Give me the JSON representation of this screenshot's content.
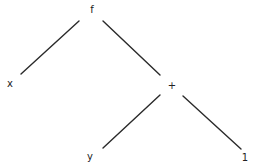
{
  "diagram": {
    "type": "expression-tree",
    "nodes": [
      {
        "id": "f",
        "label": "f",
        "x": 92,
        "y": 10
      },
      {
        "id": "x",
        "label": "x",
        "x": 10,
        "y": 84
      },
      {
        "id": "plus",
        "label": "+",
        "x": 172,
        "y": 86
      },
      {
        "id": "y",
        "label": "y",
        "x": 90,
        "y": 157
      },
      {
        "id": "one",
        "label": "1",
        "x": 245,
        "y": 158
      }
    ],
    "edges": [
      {
        "from": "f",
        "to": "x",
        "x1": 79,
        "y1": 21,
        "x2": 21,
        "y2": 74
      },
      {
        "from": "f",
        "to": "plus",
        "x1": 103,
        "y1": 21,
        "x2": 160,
        "y2": 75
      },
      {
        "from": "plus",
        "to": "y",
        "x1": 160,
        "y1": 95,
        "x2": 103,
        "y2": 148
      },
      {
        "from": "plus",
        "to": "one",
        "x1": 183,
        "y1": 96,
        "x2": 241,
        "y2": 149
      }
    ]
  }
}
